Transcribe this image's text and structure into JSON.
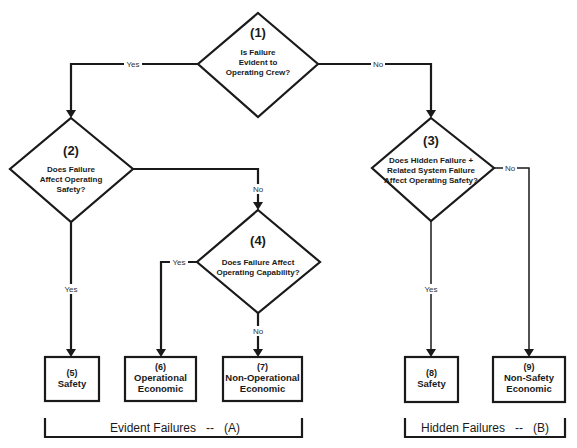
{
  "diagram": {
    "type": "flowchart",
    "decisions": [
      {
        "id": "1",
        "number": "(1)",
        "lines": [
          "Is Failure",
          "Evident to",
          "Operating Crew?"
        ]
      },
      {
        "id": "2",
        "number": "(2)",
        "lines": [
          "Does Failure",
          "Affect Operating",
          "Safety?"
        ]
      },
      {
        "id": "3",
        "number": "(3)",
        "lines": [
          "Does Hidden Failure  +",
          "Related System Failure",
          "Affect Operating Safety?"
        ]
      },
      {
        "id": "4",
        "number": "(4)",
        "lines": [
          "Does Failure Affect",
          "Operating Capability?"
        ]
      }
    ],
    "outcomes": [
      {
        "id": "5",
        "number": "(5)",
        "lines": [
          "Safety"
        ]
      },
      {
        "id": "6",
        "number": "(6)",
        "lines": [
          "Operational",
          "Economic"
        ]
      },
      {
        "id": "7",
        "number": "(7)",
        "lines": [
          "Non-Operational",
          "Economic"
        ]
      },
      {
        "id": "8",
        "number": "(8)",
        "lines": [
          "Safety"
        ]
      },
      {
        "id": "9",
        "number": "(9)",
        "lines": [
          "Non-Safety",
          "Economic"
        ]
      }
    ],
    "edges": [
      {
        "from": "1",
        "to": "2",
        "label": "Yes"
      },
      {
        "from": "1",
        "to": "3",
        "label": "No"
      },
      {
        "from": "2",
        "to": "5",
        "label": "Yes"
      },
      {
        "from": "2",
        "to": "4",
        "label": "No"
      },
      {
        "from": "4",
        "to": "6",
        "label": "Yes"
      },
      {
        "from": "4",
        "to": "7",
        "label": "No"
      },
      {
        "from": "3",
        "to": "8",
        "label": "Yes"
      },
      {
        "from": "3",
        "to": "9",
        "label": "No"
      }
    ],
    "groups": [
      {
        "label": "Evident Failures   --   (A)",
        "members": [
          "5",
          "6",
          "7"
        ]
      },
      {
        "label": "Hidden Failures   --   (B)",
        "members": [
          "8",
          "9"
        ]
      }
    ]
  }
}
